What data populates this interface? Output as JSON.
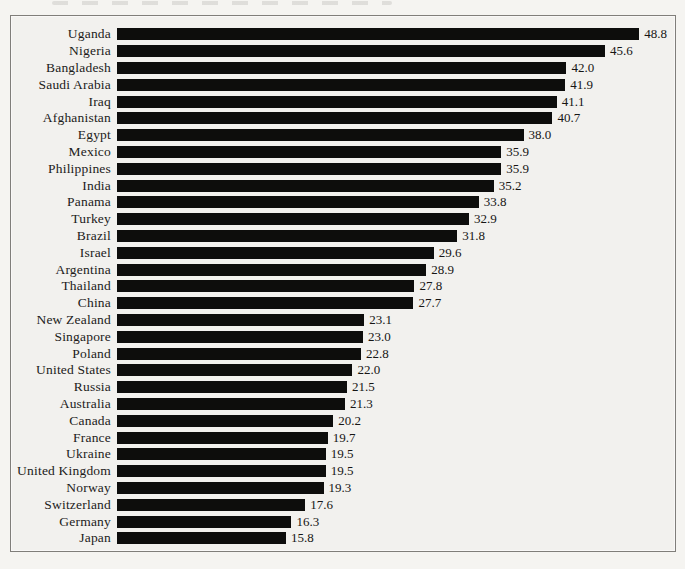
{
  "page": {
    "background_color": "#f5f4f1"
  },
  "chart_data": {
    "type": "bar",
    "orientation": "horizontal",
    "bar_color": "#0d0d0c",
    "plot_background": "#f2f1ee",
    "frame_border_color": "#807e7a",
    "legend": "none",
    "grid": false,
    "value_labels_shown": true,
    "categories": [
      "Uganda",
      "Nigeria",
      "Bangladesh",
      "Saudi Arabia",
      "Iraq",
      "Afghanistan",
      "Egypt",
      "Mexico",
      "Philippines",
      "India",
      "Panama",
      "Turkey",
      "Brazil",
      "Israel",
      "Argentina",
      "Thailand",
      "China",
      "New Zealand",
      "Singapore",
      "Poland",
      "United States",
      "Russia",
      "Australia",
      "Canada",
      "France",
      "Ukraine",
      "United Kingdom",
      "Norway",
      "Switzerland",
      "Germany",
      "Japan"
    ],
    "values": [
      48.8,
      45.6,
      42.0,
      41.9,
      41.1,
      40.7,
      38.0,
      35.9,
      35.9,
      35.2,
      33.8,
      32.9,
      31.8,
      29.6,
      28.9,
      27.8,
      27.7,
      23.1,
      23.0,
      22.8,
      22.0,
      21.5,
      21.3,
      20.2,
      19.7,
      19.5,
      19.5,
      19.3,
      17.6,
      16.3,
      15.8
    ]
  }
}
